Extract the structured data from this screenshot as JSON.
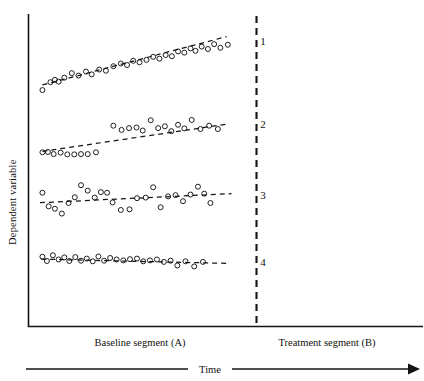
{
  "chart_data": {
    "type": "scatter",
    "title": "",
    "xlabel": "Time",
    "ylabel": "Dependent variable",
    "grid": false,
    "legend": "right-inline",
    "xlim": [
      0,
      100
    ],
    "ylim": [
      0,
      100
    ],
    "axis_labels": {
      "y_axis_title": "Dependent variable",
      "x_axis_title": "Time",
      "phase_a": "Baseline segment (A)",
      "phase_b": "Treatment segment (B)"
    },
    "annotations": {
      "phase_divider_label": "",
      "phase_divider_x": 76,
      "series_labels": [
        "1",
        "2",
        "3",
        "4"
      ]
    },
    "series": [
      {
        "name": "1",
        "label": "1",
        "label_x": 92.5,
        "label_y": 93.0,
        "trendline": {
          "x1": 5.0,
          "y1": 78.5,
          "x2": 79.0,
          "y2": 94.5
        },
        "points": [
          {
            "x": 5.0,
            "y": 76.8
          },
          {
            "x": 8.2,
            "y": 79.4
          },
          {
            "x": 10.0,
            "y": 80.2
          },
          {
            "x": 11.5,
            "y": 79.6
          },
          {
            "x": 13.8,
            "y": 80.9
          },
          {
            "x": 16.8,
            "y": 82.4
          },
          {
            "x": 19.5,
            "y": 81.6
          },
          {
            "x": 22.5,
            "y": 82.9
          },
          {
            "x": 24.8,
            "y": 82.0
          },
          {
            "x": 27.8,
            "y": 83.6
          },
          {
            "x": 30.5,
            "y": 83.2
          },
          {
            "x": 33.5,
            "y": 84.7
          },
          {
            "x": 36.5,
            "y": 85.6
          },
          {
            "x": 39.0,
            "y": 85.1
          },
          {
            "x": 41.5,
            "y": 86.5
          },
          {
            "x": 44.0,
            "y": 86.0
          },
          {
            "x": 46.8,
            "y": 86.8
          },
          {
            "x": 49.5,
            "y": 87.8
          },
          {
            "x": 52.0,
            "y": 87.2
          },
          {
            "x": 54.5,
            "y": 88.4
          },
          {
            "x": 57.0,
            "y": 88.0
          },
          {
            "x": 59.5,
            "y": 89.6
          },
          {
            "x": 62.0,
            "y": 89.2
          },
          {
            "x": 64.5,
            "y": 90.6
          },
          {
            "x": 66.5,
            "y": 89.8
          },
          {
            "x": 69.0,
            "y": 91.2
          },
          {
            "x": 71.5,
            "y": 90.4
          },
          {
            "x": 74.0,
            "y": 92.0
          },
          {
            "x": 76.5,
            "y": 90.8
          },
          {
            "x": 79.5,
            "y": 91.8
          }
        ]
      },
      {
        "name": "2",
        "label": "2",
        "label_x": 92.5,
        "label_y": 65.5,
        "trendline": {
          "x1": 5.0,
          "y1": 56.5,
          "x2": 79.0,
          "y2": 65.5
        },
        "points": [
          {
            "x": 5.0,
            "y": 56.2
          },
          {
            "x": 7.2,
            "y": 56.3
          },
          {
            "x": 9.5,
            "y": 55.6
          },
          {
            "x": 12.3,
            "y": 56.1
          },
          {
            "x": 15.0,
            "y": 55.5
          },
          {
            "x": 17.8,
            "y": 55.5
          },
          {
            "x": 20.5,
            "y": 55.6
          },
          {
            "x": 23.2,
            "y": 55.6
          },
          {
            "x": 26.5,
            "y": 56.2
          },
          {
            "x": 33.5,
            "y": 65.0
          },
          {
            "x": 36.8,
            "y": 63.6
          },
          {
            "x": 39.8,
            "y": 64.2
          },
          {
            "x": 42.8,
            "y": 64.4
          },
          {
            "x": 45.3,
            "y": 63.4
          },
          {
            "x": 48.5,
            "y": 66.8
          },
          {
            "x": 51.5,
            "y": 64.2
          },
          {
            "x": 54.2,
            "y": 64.8
          },
          {
            "x": 56.8,
            "y": 63.2
          },
          {
            "x": 59.5,
            "y": 65.3
          },
          {
            "x": 62.0,
            "y": 64.1
          },
          {
            "x": 65.0,
            "y": 66.9
          },
          {
            "x": 68.5,
            "y": 63.9
          },
          {
            "x": 72.0,
            "y": 65.0
          },
          {
            "x": 75.5,
            "y": 63.9
          }
        ]
      },
      {
        "name": "3",
        "label": "3",
        "label_x": 92.5,
        "label_y": 42.0,
        "trendline": {
          "x1": 4.0,
          "y1": 39.5,
          "x2": 81.0,
          "y2": 42.5
        },
        "points": [
          {
            "x": 5.0,
            "y": 42.8
          },
          {
            "x": 7.5,
            "y": 38.3
          },
          {
            "x": 10.0,
            "y": 37.5
          },
          {
            "x": 12.8,
            "y": 35.9
          },
          {
            "x": 15.5,
            "y": 39.4
          },
          {
            "x": 18.0,
            "y": 41.3
          },
          {
            "x": 20.5,
            "y": 45.3
          },
          {
            "x": 23.2,
            "y": 43.5
          },
          {
            "x": 26.0,
            "y": 41.2
          },
          {
            "x": 28.5,
            "y": 43.0
          },
          {
            "x": 31.0,
            "y": 42.8
          },
          {
            "x": 33.2,
            "y": 39.6
          },
          {
            "x": 36.5,
            "y": 37.1
          },
          {
            "x": 40.0,
            "y": 37.3
          },
          {
            "x": 43.0,
            "y": 41.0
          },
          {
            "x": 46.5,
            "y": 41.2
          },
          {
            "x": 49.5,
            "y": 44.6
          },
          {
            "x": 52.5,
            "y": 38.0
          },
          {
            "x": 55.5,
            "y": 41.6
          },
          {
            "x": 58.5,
            "y": 42.0
          },
          {
            "x": 61.5,
            "y": 40.0
          },
          {
            "x": 64.5,
            "y": 42.2
          },
          {
            "x": 67.5,
            "y": 44.8
          },
          {
            "x": 70.0,
            "y": 42.5
          },
          {
            "x": 72.5,
            "y": 39.4
          }
        ]
      },
      {
        "name": "4",
        "label": "4",
        "label_x": 92.5,
        "label_y": 20.0,
        "trendline": {
          "x1": 4.5,
          "y1": 20.8,
          "x2": 80.0,
          "y2": 19.4
        },
        "points": [
          {
            "x": 5.0,
            "y": 21.6
          },
          {
            "x": 6.8,
            "y": 20.2
          },
          {
            "x": 9.2,
            "y": 22.1
          },
          {
            "x": 11.5,
            "y": 20.7
          },
          {
            "x": 13.8,
            "y": 21.4
          },
          {
            "x": 15.8,
            "y": 20.2
          },
          {
            "x": 18.2,
            "y": 21.5
          },
          {
            "x": 20.5,
            "y": 20.3
          },
          {
            "x": 22.8,
            "y": 21.0
          },
          {
            "x": 25.2,
            "y": 20.1
          },
          {
            "x": 27.5,
            "y": 21.7
          },
          {
            "x": 29.8,
            "y": 20.3
          },
          {
            "x": 32.2,
            "y": 21.2
          },
          {
            "x": 34.8,
            "y": 20.7
          },
          {
            "x": 37.5,
            "y": 20.4
          },
          {
            "x": 40.2,
            "y": 20.8
          },
          {
            "x": 43.0,
            "y": 21.0
          },
          {
            "x": 45.5,
            "y": 20.1
          },
          {
            "x": 48.2,
            "y": 20.4
          },
          {
            "x": 51.0,
            "y": 20.7
          },
          {
            "x": 53.8,
            "y": 19.9
          },
          {
            "x": 56.5,
            "y": 20.3
          },
          {
            "x": 59.2,
            "y": 18.7
          },
          {
            "x": 62.5,
            "y": 20.1
          },
          {
            "x": 66.0,
            "y": 18.4
          },
          {
            "x": 69.5,
            "y": 19.9
          }
        ]
      }
    ]
  },
  "figure": {
    "y_axis_title": "Dependent variable",
    "x_axis_title": "Time",
    "phase_a_label": "Baseline segment (A)",
    "phase_b_label": "Treatment segment (B)",
    "series_label_1": "1",
    "series_label_2": "2",
    "series_label_3": "3",
    "series_label_4": "4"
  },
  "colors": {
    "ink": "#141414",
    "background": "#ffffff"
  }
}
